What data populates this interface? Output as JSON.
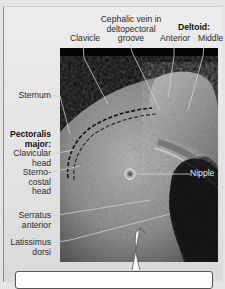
{
  "figure": {
    "labels_top": {
      "clavicle": "Clavicle",
      "cephalic_vein": [
        "Cephalic vein in",
        "deltopectoral",
        "groove"
      ],
      "deltoid_heading": "Deltoid:",
      "deltoid_anterior": "Anterior",
      "deltoid_middle": "Middle"
    },
    "labels_left": {
      "sternum": "Sternum",
      "pectoralis_heading": [
        "Pectoralis",
        "major:"
      ],
      "clavicular_head": [
        "Clavicular",
        "head"
      ],
      "sternocostal_head": [
        "Sterno-",
        "costal",
        "head"
      ],
      "serratus_anterior": [
        "Serratus",
        "anterior"
      ],
      "latissimus_dorsi": [
        "Latissimus",
        "dorsi"
      ]
    },
    "labels_right": {
      "nipple": "Nipple"
    },
    "colors": {
      "panel_bg": "#e4e4e4",
      "photo_bg": "#050505",
      "muscle_tone": "#9a9a9a",
      "leader_line": "#c8c8c8",
      "label_text": "#2a2a2a"
    }
  }
}
